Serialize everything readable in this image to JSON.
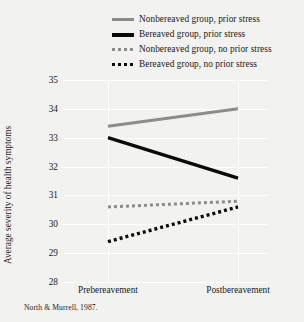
{
  "chart_data": {
    "type": "line",
    "title": "",
    "subtitle": "",
    "xlabel": "",
    "ylabel": "Average severity of health symptoms",
    "categories": [
      "Prebereavement",
      "Postbereavement"
    ],
    "ylim": [
      28,
      35
    ],
    "yticks": [
      28,
      29,
      30,
      31,
      32,
      33,
      34,
      35
    ],
    "ytick_labels": [
      "28",
      "29",
      "30",
      "31",
      "32",
      "33",
      "34",
      "35"
    ],
    "grid": true,
    "grid_color": "#ffffff",
    "legend_position": "top",
    "series": [
      {
        "name": "Nonbereaved group, prior stress",
        "values": [
          33.4,
          34.0
        ],
        "color": "#8c8c8c",
        "style": "solid",
        "width": 3,
        "key": "solid-gray"
      },
      {
        "name": "Bereaved group, prior stress",
        "values": [
          33.0,
          31.6
        ],
        "color": "#0b0b0b",
        "style": "solid",
        "width": 3.4,
        "key": "solid-black"
      },
      {
        "name": "Nonbereaved group, no prior stress",
        "values": [
          30.6,
          30.8
        ],
        "color": "#8c8c8c",
        "style": "dotted",
        "width": 3,
        "key": "dot-gray"
      },
      {
        "name": "Bereaved group, no prior stress",
        "values": [
          29.4,
          30.6
        ],
        "color": "#0b0b0b",
        "style": "dotted",
        "width": 3.4,
        "key": "dot-black"
      }
    ],
    "annotations": [
      {
        "name": "source-note",
        "text": "North & Murrell, 1987."
      }
    ]
  },
  "source_note": "North & Murrell, 1987.",
  "colors": {
    "background": "#f2f2f0",
    "grid": "#ffffff",
    "gray_series": "#8c8c8c",
    "black_series": "#0b0b0b",
    "text": "#1a1a1a"
  }
}
